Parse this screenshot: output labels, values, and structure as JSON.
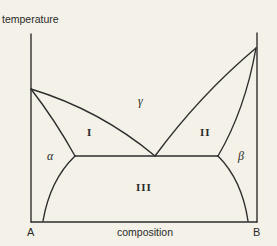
{
  "diagram": {
    "type": "binary eutectic phase diagram",
    "axes": {
      "y_label": "temperature",
      "x_label": "composition",
      "left_component": "A",
      "right_component": "B"
    },
    "regions": {
      "liquid": "γ",
      "liquid_plus_alpha": "I",
      "liquid_plus_beta": "II",
      "alpha_plus_beta": "III",
      "alpha": "α",
      "beta": "β"
    },
    "colors": {
      "line": "#2e2e2e",
      "background": "#f3f1e8",
      "text": "#2a2a2a"
    }
  }
}
